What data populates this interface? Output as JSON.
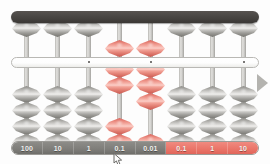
{
  "app": {
    "title": "Abacus (Soroban) place-value demonstration"
  },
  "abacus": {
    "rod_count": 8,
    "beads_per_rod": {
      "heaven": 1,
      "earth": 4
    },
    "colors": {
      "frame": "#4a4744",
      "reckoning_bar": "#ffffff",
      "bead_gray": "#9d9c98",
      "bead_red": "#ea7468",
      "label_gray": "#7e7d79",
      "label_red": "#ea7468",
      "arrow": "#b4b3af"
    },
    "rods": [
      {
        "index": 1,
        "label": "100",
        "label_style": "gray",
        "bead_color": "gray",
        "heaven_active": false,
        "earth_active": 0
      },
      {
        "index": 2,
        "label": "10",
        "label_style": "gray",
        "bead_color": "gray",
        "heaven_active": false,
        "earth_active": 0
      },
      {
        "index": 3,
        "label": "1",
        "label_style": "gray",
        "bead_color": "gray",
        "heaven_active": false,
        "earth_active": 0
      },
      {
        "index": 4,
        "label": "0.1",
        "label_style": "gray",
        "bead_color": "red",
        "heaven_active": true,
        "earth_active": 2
      },
      {
        "index": 5,
        "label": "0.01",
        "label_style": "gray",
        "bead_color": "red",
        "heaven_active": true,
        "earth_active": 3
      },
      {
        "index": 6,
        "label": "0.1",
        "label_style": "red",
        "bead_color": "gray",
        "heaven_active": false,
        "earth_active": 0
      },
      {
        "index": 7,
        "label": "1",
        "label_style": "red",
        "bead_color": "gray",
        "heaven_active": false,
        "earth_active": 0
      },
      {
        "index": 8,
        "label": "10",
        "label_style": "red",
        "bead_color": "gray",
        "heaven_active": false,
        "earth_active": 0
      }
    ],
    "unit_dots": [
      2.5,
      4.5,
      7.5
    ]
  },
  "controls": {
    "next_arrow_label": "next"
  },
  "pointer": {
    "icon": "mouse-cursor-icon"
  }
}
